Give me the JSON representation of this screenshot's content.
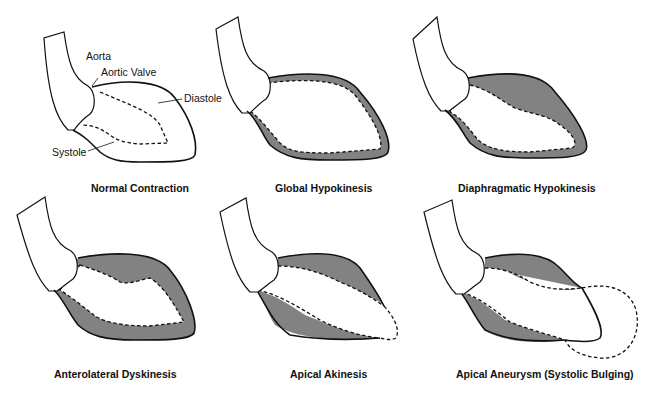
{
  "diagram": {
    "panels": [
      {
        "id": "normal",
        "caption": "Normal Contraction",
        "labels": {
          "aorta": "Aorta",
          "valve": "Aortic Valve",
          "diastole": "Diastole",
          "systole": "Systole"
        }
      },
      {
        "id": "global",
        "caption": "Global Hypokinesis"
      },
      {
        "id": "diaphragmatic",
        "caption": "Diaphragmatic Hypokinesis"
      },
      {
        "id": "anterolateral",
        "caption": "Anterolateral Dyskinesis"
      },
      {
        "id": "apical-akinesis",
        "caption": "Apical Akinesis"
      },
      {
        "id": "apical-aneurysm",
        "caption": "Apical Aneurysm (Systolic Bulging)"
      }
    ],
    "legend": {
      "solid_line": "Diastole",
      "dashed_line": "Systole",
      "shaded": "wall motion region"
    },
    "colors": {
      "shading": "#828282",
      "line": "#111111",
      "background": "#ffffff"
    }
  }
}
